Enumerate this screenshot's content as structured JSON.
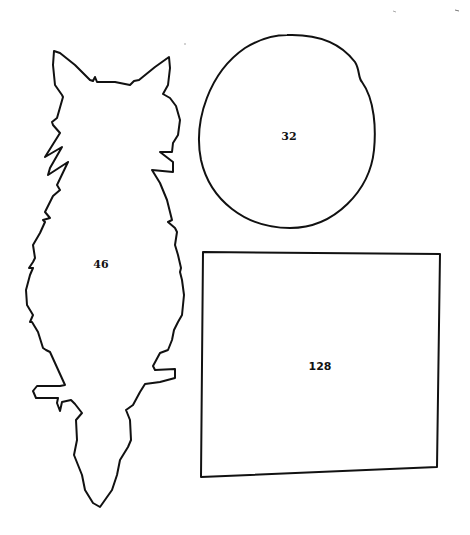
{
  "shapes": [
    {
      "name": "cat",
      "label": "46"
    },
    {
      "name": "circle",
      "label": "32"
    },
    {
      "name": "rectangle",
      "label": "128"
    }
  ],
  "colors": {
    "stroke": "#111111",
    "background": "#ffffff"
  }
}
